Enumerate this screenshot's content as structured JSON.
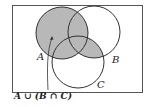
{
  "diagram": {
    "type": "venn",
    "sets": [
      {
        "label": "A",
        "cx": 62,
        "cy": 33,
        "r": 26
      },
      {
        "label": "B",
        "cx": 94,
        "cy": 32,
        "r": 26
      },
      {
        "label": "C",
        "cx": 78,
        "cy": 62,
        "r": 26
      }
    ],
    "shaded_region": "A ∪ (B ∩ C)",
    "caption": "A ∪ (B ∩ C)",
    "colors": {
      "shade": "#b8b8b8",
      "stroke": "#333333",
      "border": "#555555"
    }
  }
}
